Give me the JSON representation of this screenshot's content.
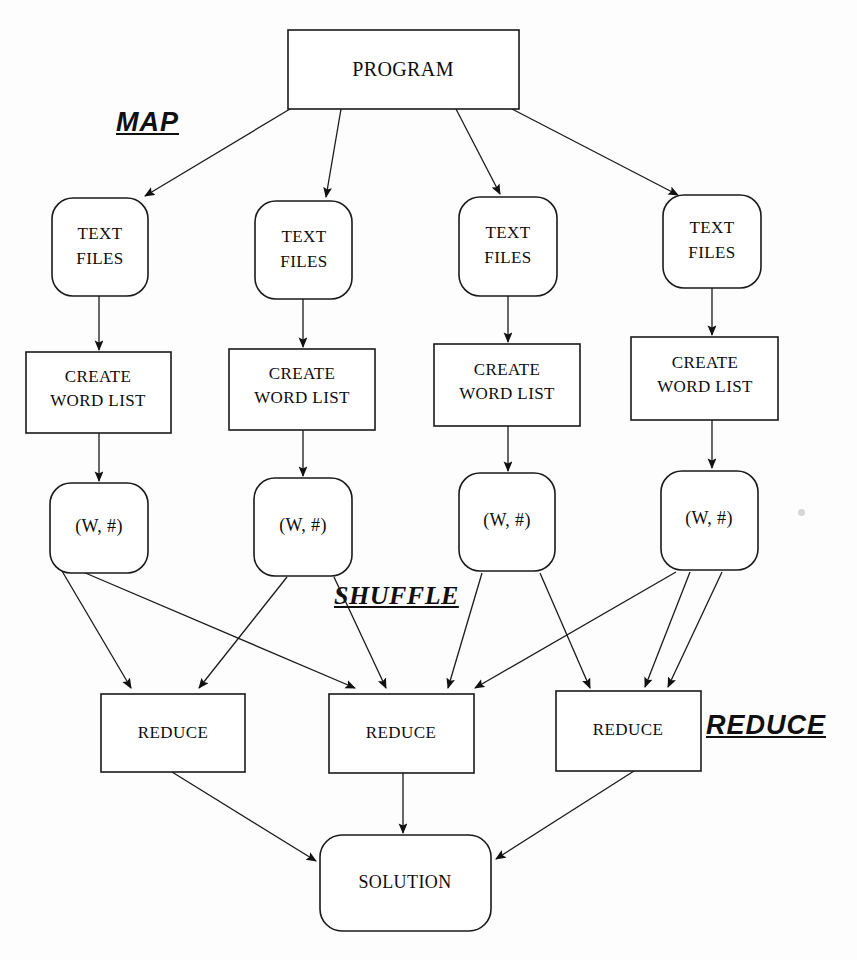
{
  "diagram": {
    "background_color": "#fdfdfd",
    "line_color": "#1a1a1a",
    "text_color": "#0d0d0d",
    "stage_labels": {
      "map": "MAP",
      "shuffle": "SHUFFLE",
      "reduce": "REDUCE"
    },
    "nodes": {
      "program": {
        "label": "PROGRAM",
        "shape": "rectangle"
      },
      "text_files": {
        "shape": "rounded-rectangle",
        "line1": "TEXT",
        "line2": "FILES",
        "labels": [
          "TEXT FILES",
          "TEXT FILES",
          "TEXT FILES",
          "TEXT FILES"
        ]
      },
      "create_word_list": {
        "shape": "rectangle",
        "line1": "CREATE",
        "line2": "WORD LIST",
        "labels": [
          "CREATE WORD LIST",
          "CREATE WORD LIST",
          "CREATE WORD LIST",
          "CREATE WORD LIST"
        ]
      },
      "pairs": {
        "shape": "rounded-rectangle",
        "label": "(W, #)",
        "labels": [
          "(W, #)",
          "(W, #)",
          "(W, #)",
          "(W, #)"
        ]
      },
      "reduce": {
        "shape": "rectangle",
        "label": "REDUCE",
        "labels": [
          "REDUCE",
          "REDUCE",
          "REDUCE"
        ]
      },
      "solution": {
        "label": "SOLUTION",
        "shape": "rounded-rectangle"
      }
    },
    "counts": {
      "mappers": 4,
      "reducers": 3
    }
  }
}
